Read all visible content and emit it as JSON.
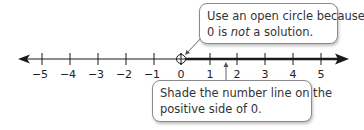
{
  "number_line": {
    "min": -5,
    "max": 5,
    "tick_labels": [
      "−5",
      "−4",
      "−3",
      "−2",
      "−1",
      "0",
      "1",
      "2",
      "3",
      "4",
      "5"
    ],
    "open_circle_at": 0,
    "shaded_direction": "positive",
    "line_color": "#1a1a1a"
  },
  "callouts": {
    "top": {
      "line1": "Use an open circle because",
      "line2_prefix": "0 is ",
      "line2_emphasis": "not",
      "line2_suffix": " a solution."
    },
    "bottom": {
      "line1": "Shade the number line on the",
      "line2": "positive side of 0."
    }
  }
}
